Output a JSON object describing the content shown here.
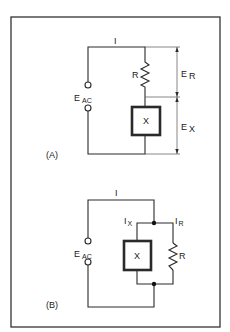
{
  "diagram_a": {
    "label": "(A)",
    "current": "I",
    "source": {
      "main": "E",
      "sub": "AC"
    },
    "resistor": "R",
    "reactance": "X",
    "voltage_r": {
      "main": "E",
      "sub": "R"
    },
    "voltage_x": {
      "main": "E",
      "sub": "X"
    }
  },
  "diagram_b": {
    "label": "(B)",
    "current": "I",
    "source": {
      "main": "E",
      "sub": "AC"
    },
    "current_x": {
      "main": "I",
      "sub": "X"
    },
    "current_r": {
      "main": "I",
      "sub": "R"
    },
    "reactance": "X",
    "resistor": "R"
  },
  "colors": {
    "line": "#2a2a2a",
    "frame": "#333333",
    "background": "#ffffff"
  }
}
